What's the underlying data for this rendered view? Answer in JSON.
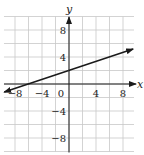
{
  "chart_data": {
    "type": "line",
    "title": "",
    "xlabel": "x",
    "ylabel": "y",
    "xlim": [
      -9.6,
      9.6
    ],
    "ylim": [
      -10,
      10
    ],
    "grid": true,
    "grid_step": 2,
    "x_ticks": [
      -8,
      -4,
      0,
      4,
      8
    ],
    "x_tick_labels": [
      "-8",
      "-4",
      "0",
      "4",
      "8"
    ],
    "y_ticks": [
      8,
      4,
      -4,
      -8
    ],
    "y_tick_labels": [
      "8",
      "4",
      "-4",
      "-8"
    ],
    "series": [
      {
        "name": "line",
        "equation": "y = (1/3)x + 2",
        "slope": 0.3333,
        "intercept": 2,
        "points": [
          [
            -9.6,
            -1.2
          ],
          [
            -6,
            0
          ],
          [
            0,
            2
          ],
          [
            9.5,
            5.17
          ]
        ],
        "arrows": "both",
        "color": "#1a1a1a"
      }
    ],
    "legend": null
  },
  "colors": {
    "grid": "#c8c8c8",
    "axis": "#1a1a1a",
    "line": "#1a1a1a"
  }
}
